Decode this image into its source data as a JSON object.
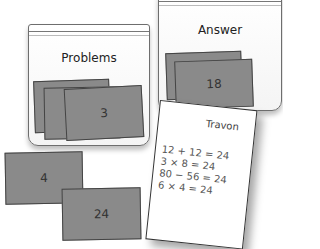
{
  "problems_bag": {
    "label": "Problems",
    "top_card": "3"
  },
  "answer_bag": {
    "label": "Answer",
    "top_card": "18"
  },
  "loose_cards": [
    {
      "value": "4"
    },
    {
      "value": "24"
    }
  ],
  "paper": {
    "name": "Travon",
    "lines": [
      "12 + 12 = 24",
      "3 × 8 = 24",
      "80 − 56 = 24",
      "6 × 4 = 24"
    ]
  },
  "colors": {
    "card": "#8a8a8a",
    "card_border": "#444444",
    "bag_border": "#6e6e6e",
    "paper": "#ffffff"
  }
}
